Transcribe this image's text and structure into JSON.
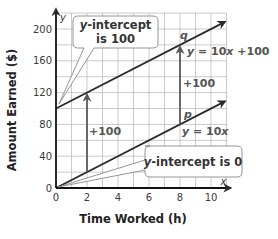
{
  "chart_data": {
    "type": "line",
    "title": "",
    "xlabel": "Time Worked (h)",
    "ylabel": "Amount Earned ($)",
    "x_axis_letter": "x",
    "y_axis_letter": "y",
    "xlim": [
      0,
      11
    ],
    "ylim": [
      0,
      220
    ],
    "x_ticks": [
      0,
      2,
      4,
      6,
      8,
      10
    ],
    "y_ticks": [
      0,
      40,
      80,
      120,
      160,
      200
    ],
    "x_tick_labels": [
      "0",
      "2",
      "4",
      "6",
      "8",
      "10"
    ],
    "y_tick_labels": [
      "0",
      "40",
      "80",
      "120",
      "160",
      "200"
    ],
    "grid": true,
    "grid_x_step": 1,
    "grid_y_step": 20,
    "series": [
      {
        "name": "q",
        "equation": "y = 10x + 100",
        "x": [
          0,
          10.9
        ],
        "y": [
          100,
          209
        ],
        "slope": 10,
        "intercept": 100
      },
      {
        "name": "p",
        "equation": "y = 10x",
        "x": [
          0,
          10.9
        ],
        "y": [
          0,
          109
        ],
        "slope": 10,
        "intercept": 0
      }
    ],
    "annotations": [
      {
        "text": "y-intercept is 100",
        "points_to": [
          0,
          100
        ]
      },
      {
        "text": "y-intercept is 0",
        "points_to": [
          0,
          0
        ]
      },
      {
        "text": "+100",
        "arrow_from": [
          2,
          20
        ],
        "arrow_to": [
          2,
          120
        ]
      },
      {
        "text": "+100",
        "arrow_from": [
          8,
          80
        ],
        "arrow_to": [
          8,
          180
        ]
      }
    ]
  },
  "labels": {
    "q_name": "q",
    "p_name": "p",
    "q_eq_y": "y",
    "q_eq_rest": " = 10",
    "q_eq_x": "x",
    "q_eq_tail": " +100",
    "p_eq_y": "y",
    "p_eq_rest": " = 10",
    "p_eq_x": "x",
    "plus_left": "+100",
    "plus_right": "+100",
    "callout_top_line1_it": "y",
    "callout_top_line1_rest": "-intercept",
    "callout_top_line2": "is 100",
    "callout_bottom_it": "y",
    "callout_bottom_rest": "-intercept is 0"
  }
}
